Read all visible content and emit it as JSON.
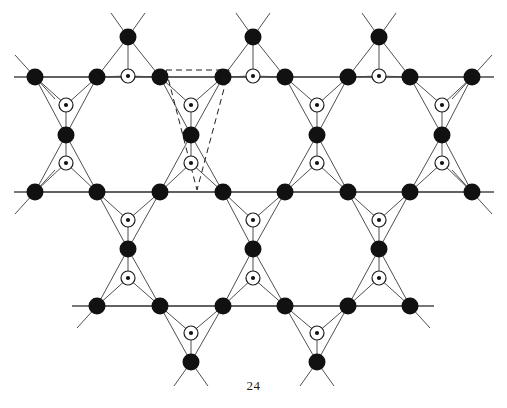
{
  "figure": {
    "caption": "24",
    "title": "",
    "kind": "crystal-lattice-diagram"
  },
  "style": {
    "background": "#ffffff",
    "bond_color": "#3b3b3b",
    "bond_width": 0.9,
    "rule_color": "#4a4a4a",
    "rule_width": 1.3,
    "dashed_color": "#1f1f1f",
    "dashed_width": 1.0,
    "dash_pattern": "6,4",
    "filled_node_fill": "#111111",
    "filled_node_radius": 8.5,
    "open_node_stroke": "#1c1c1c",
    "open_node_fill": "#ffffff",
    "open_node_radius": 7,
    "open_node_stroke_width": 1.2,
    "centre_dot_fill": "#111111",
    "centre_dot_radius": 2.1
  },
  "geometry": {
    "row_y": [
      77,
      192,
      306
    ],
    "apex_up_y": 37,
    "apex_down_y": 362,
    "col_spacing": 62.7,
    "row_x_start": 35,
    "columns": 8
  },
  "chart_data": {
    "type": "scatter",
    "title": "",
    "xlabel": "",
    "ylabel": "",
    "grid": false,
    "legend": "none",
    "rules": [
      {
        "name": "top-lattice-row",
        "x1": 14,
        "y1": 77,
        "x2": 494,
        "y2": 77
      },
      {
        "name": "middle-lattice-row",
        "x1": 14,
        "y1": 192,
        "x2": 494,
        "y2": 192
      },
      {
        "name": "bottom-lattice-row",
        "x1": 72,
        "y1": 306,
        "x2": 434,
        "y2": 306
      }
    ],
    "filled_nodes": [
      {
        "id": "A1",
        "x": 35,
        "y": 77
      },
      {
        "id": "A2",
        "x": 97,
        "y": 77
      },
      {
        "id": "A3",
        "x": 160,
        "y": 77
      },
      {
        "id": "A4",
        "x": 223,
        "y": 77
      },
      {
        "id": "A5",
        "x": 285,
        "y": 77
      },
      {
        "id": "A6",
        "x": 348,
        "y": 77
      },
      {
        "id": "A7",
        "x": 410,
        "y": 77
      },
      {
        "id": "A8",
        "x": 472,
        "y": 77
      },
      {
        "id": "B1",
        "x": 35,
        "y": 192
      },
      {
        "id": "B2",
        "x": 97,
        "y": 192
      },
      {
        "id": "B3",
        "x": 160,
        "y": 192
      },
      {
        "id": "B4",
        "x": 223,
        "y": 192
      },
      {
        "id": "B5",
        "x": 285,
        "y": 192
      },
      {
        "id": "B6",
        "x": 348,
        "y": 192
      },
      {
        "id": "B7",
        "x": 410,
        "y": 192
      },
      {
        "id": "B8",
        "x": 472,
        "y": 192
      },
      {
        "id": "C1",
        "x": 97,
        "y": 306
      },
      {
        "id": "C2",
        "x": 160,
        "y": 306
      },
      {
        "id": "C3",
        "x": 223,
        "y": 306
      },
      {
        "id": "C4",
        "x": 285,
        "y": 306
      },
      {
        "id": "C5",
        "x": 348,
        "y": 306
      },
      {
        "id": "C6",
        "x": 410,
        "y": 306
      },
      {
        "id": "U1",
        "x": 128,
        "y": 37
      },
      {
        "id": "U2",
        "x": 253,
        "y": 37
      },
      {
        "id": "U3",
        "x": 379,
        "y": 37
      },
      {
        "id": "M1",
        "x": 66,
        "y": 135
      },
      {
        "id": "M2",
        "x": 191,
        "y": 135
      },
      {
        "id": "M3",
        "x": 317,
        "y": 135
      },
      {
        "id": "M4",
        "x": 442,
        "y": 135
      },
      {
        "id": "N1",
        "x": 128,
        "y": 249
      },
      {
        "id": "N2",
        "x": 253,
        "y": 249
      },
      {
        "id": "N3",
        "x": 379,
        "y": 249
      },
      {
        "id": "D1",
        "x": 191,
        "y": 362
      },
      {
        "id": "D2",
        "x": 317,
        "y": 362
      }
    ],
    "open_nodes": [
      {
        "id": "o1",
        "x": 128,
        "y": 76
      },
      {
        "id": "o2",
        "x": 253,
        "y": 76
      },
      {
        "id": "o3",
        "x": 379,
        "y": 76
      },
      {
        "id": "o4",
        "x": 66,
        "y": 105
      },
      {
        "id": "o5",
        "x": 191,
        "y": 105
      },
      {
        "id": "o6",
        "x": 317,
        "y": 105
      },
      {
        "id": "o7",
        "x": 442,
        "y": 105
      },
      {
        "id": "o8",
        "x": 66,
        "y": 163
      },
      {
        "id": "o9",
        "x": 191,
        "y": 163
      },
      {
        "id": "o10",
        "x": 317,
        "y": 163
      },
      {
        "id": "o11",
        "x": 442,
        "y": 163
      },
      {
        "id": "o12",
        "x": 128,
        "y": 220
      },
      {
        "id": "o13",
        "x": 253,
        "y": 220
      },
      {
        "id": "o14",
        "x": 379,
        "y": 220
      },
      {
        "id": "o15",
        "x": 128,
        "y": 278
      },
      {
        "id": "o16",
        "x": 253,
        "y": 278
      },
      {
        "id": "o17",
        "x": 379,
        "y": 278
      },
      {
        "id": "o18",
        "x": 191,
        "y": 333
      },
      {
        "id": "o19",
        "x": 317,
        "y": 333
      }
    ],
    "triangles": [
      {
        "a": "A2",
        "b": "A3",
        "c": "U1",
        "centre": "o1"
      },
      {
        "a": "A4",
        "b": "A5",
        "c": "U2",
        "centre": "o2"
      },
      {
        "a": "A6",
        "b": "A7",
        "c": "U3",
        "centre": "o3"
      },
      {
        "a": "A1",
        "b": "A2",
        "c": "M1",
        "centre": "o4"
      },
      {
        "a": "A3",
        "b": "A4",
        "c": "M2",
        "centre": "o5"
      },
      {
        "a": "A5",
        "b": "A6",
        "c": "M3",
        "centre": "o6"
      },
      {
        "a": "A7",
        "b": "A8",
        "c": "M4",
        "centre": "o7"
      },
      {
        "a": "B1",
        "b": "B2",
        "c": "M1",
        "centre": "o8"
      },
      {
        "a": "B3",
        "b": "B4",
        "c": "M2",
        "centre": "o9"
      },
      {
        "a": "B5",
        "b": "B6",
        "c": "M3",
        "centre": "o10"
      },
      {
        "a": "B7",
        "b": "B8",
        "c": "M4",
        "centre": "o11"
      },
      {
        "a": "B2",
        "b": "B3",
        "c": "N1",
        "centre": "o12"
      },
      {
        "a": "B4",
        "b": "B5",
        "c": "N2",
        "centre": "o13"
      },
      {
        "a": "B6",
        "b": "B7",
        "c": "N3",
        "centre": "o14"
      },
      {
        "a": "C1",
        "b": "C2",
        "c": "N1",
        "centre": "o15"
      },
      {
        "a": "C3",
        "b": "C4",
        "c": "N2",
        "centre": "o16"
      },
      {
        "a": "C5",
        "b": "C6",
        "c": "N3",
        "centre": "o17"
      },
      {
        "a": "C2",
        "b": "C3",
        "c": "D1",
        "centre": "o18"
      },
      {
        "a": "C4",
        "b": "C5",
        "c": "D2",
        "centre": "o19"
      }
    ],
    "stubs": [
      {
        "from": "A1",
        "dx": -20,
        "dy": -22
      },
      {
        "from": "A1",
        "dx": 20,
        "dy": 22
      },
      {
        "from": "A8",
        "dx": 20,
        "dy": -22
      },
      {
        "from": "A8",
        "dx": -20,
        "dy": 22
      },
      {
        "from": "B1",
        "dx": -20,
        "dy": 22
      },
      {
        "from": "B1",
        "dx": 20,
        "dy": -22
      },
      {
        "from": "B8",
        "dx": 20,
        "dy": 22
      },
      {
        "from": "B8",
        "dx": -20,
        "dy": -22
      },
      {
        "from": "C1",
        "dx": -20,
        "dy": 22
      },
      {
        "from": "C6",
        "dx": 20,
        "dy": 22
      },
      {
        "from": "U1",
        "dx": -17,
        "dy": -24
      },
      {
        "from": "U1",
        "dx": 17,
        "dy": -24
      },
      {
        "from": "U2",
        "dx": -17,
        "dy": -24
      },
      {
        "from": "U2",
        "dx": 17,
        "dy": -24
      },
      {
        "from": "U3",
        "dx": -17,
        "dy": -24
      },
      {
        "from": "U3",
        "dx": 17,
        "dy": -24
      },
      {
        "from": "D1",
        "dx": -17,
        "dy": 24
      },
      {
        "from": "D1",
        "dx": 17,
        "dy": 24
      },
      {
        "from": "D2",
        "dx": -17,
        "dy": 24
      },
      {
        "from": "D2",
        "dx": 17,
        "dy": 24
      }
    ],
    "unit_cell": {
      "label": "",
      "vertices": [
        [
          166,
          70
        ],
        [
          229,
          70
        ],
        [
          197,
          190
        ],
        [
          166,
          70
        ]
      ],
      "extra_edges": [
        {
          "x1": 166,
          "y1": 70,
          "x2": 197,
          "y2": 190
        },
        {
          "x1": 229,
          "y1": 70,
          "x2": 197,
          "y2": 190
        },
        {
          "x1": 166,
          "y1": 70,
          "x2": 229,
          "y2": 70
        }
      ]
    }
  }
}
